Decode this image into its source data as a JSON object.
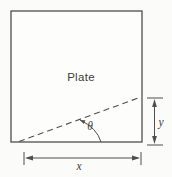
{
  "figure": {
    "plate_label": "Plate",
    "angle_label": "θ",
    "x_dim_label": "x",
    "y_dim_label": "y",
    "colors": {
      "line": "#4f4f4f",
      "label_text": "#3d3d3d",
      "background": "#fbfbfa"
    }
  }
}
